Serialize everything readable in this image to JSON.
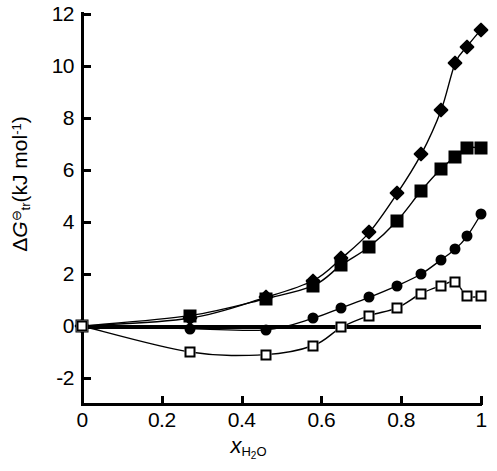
{
  "chart_data": {
    "type": "scatter",
    "title": "",
    "xlabel": "x_H2O",
    "ylabel": "ΔG_tr⦵ (kJ mol-1)",
    "xlabel_main": "x",
    "xlabel_sub": "H",
    "xlabel_sub2": "2",
    "xlabel_sub3": "O",
    "ylabel_parts": {
      "delta": "Δ",
      "g": "G",
      "sub": "tr",
      "sup": "⊖",
      "units": "(kJ mol",
      "exp": "-1",
      "close": ")"
    },
    "xlim": [
      0,
      1
    ],
    "ylim": [
      -2,
      12
    ],
    "xticks": [
      0,
      0.2,
      0.4,
      0.6,
      0.8,
      1
    ],
    "xticklabels": [
      "0",
      "0.2",
      "0.4",
      "0.6",
      "0.8",
      "1"
    ],
    "yticks": [
      -2,
      0,
      2,
      4,
      6,
      8,
      10,
      12
    ],
    "yticklabels": [
      "-2",
      "0",
      "2",
      "4",
      "6",
      "8",
      "10",
      "12"
    ],
    "grid": false,
    "legend": "none",
    "zero_line": true,
    "series": [
      {
        "name": "filled-diamond",
        "marker": "filled-diamond",
        "color": "#000000",
        "points": [
          [
            0.0,
            0.0
          ],
          [
            0.27,
            0.3
          ],
          [
            0.46,
            1.1
          ],
          [
            0.58,
            1.75
          ],
          [
            0.65,
            2.6
          ],
          [
            0.72,
            3.6
          ],
          [
            0.79,
            5.1
          ],
          [
            0.85,
            6.6
          ],
          [
            0.9,
            8.3
          ],
          [
            0.935,
            10.1
          ],
          [
            0.965,
            10.75
          ],
          [
            1.0,
            11.4
          ]
        ]
      },
      {
        "name": "filled-square",
        "marker": "filled-square",
        "color": "#000000",
        "points": [
          [
            0.0,
            0.0
          ],
          [
            0.27,
            0.4
          ],
          [
            0.46,
            1.05
          ],
          [
            0.58,
            1.55
          ],
          [
            0.65,
            2.35
          ],
          [
            0.72,
            3.05
          ],
          [
            0.79,
            4.05
          ],
          [
            0.85,
            5.2
          ],
          [
            0.9,
            6.05
          ],
          [
            0.935,
            6.5
          ],
          [
            0.965,
            6.85
          ],
          [
            1.0,
            6.85
          ]
        ]
      },
      {
        "name": "filled-circle",
        "marker": "filled-circle",
        "color": "#000000",
        "points": [
          [
            0.0,
            0.0
          ],
          [
            0.27,
            -0.1
          ],
          [
            0.46,
            -0.15
          ],
          [
            0.58,
            0.3
          ],
          [
            0.65,
            0.7
          ],
          [
            0.72,
            1.1
          ],
          [
            0.79,
            1.55
          ],
          [
            0.85,
            2.0
          ],
          [
            0.9,
            2.55
          ],
          [
            0.935,
            2.95
          ],
          [
            0.965,
            3.45
          ],
          [
            1.0,
            4.3
          ]
        ]
      },
      {
        "name": "open-square",
        "marker": "open-square",
        "color": "#000000",
        "points": [
          [
            0.0,
            0.0
          ],
          [
            0.27,
            -1.0
          ],
          [
            0.46,
            -1.1
          ],
          [
            0.58,
            -0.75
          ],
          [
            0.65,
            -0.05
          ],
          [
            0.72,
            0.4
          ],
          [
            0.79,
            0.7
          ],
          [
            0.85,
            1.25
          ],
          [
            0.9,
            1.55
          ],
          [
            0.935,
            1.7
          ],
          [
            0.965,
            1.15
          ],
          [
            1.0,
            1.15
          ]
        ]
      }
    ]
  }
}
